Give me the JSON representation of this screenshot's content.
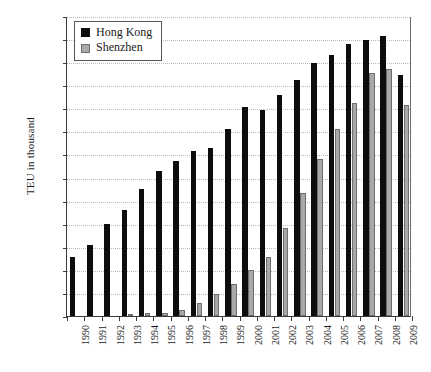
{
  "chart_data": {
    "type": "bar",
    "title": "",
    "xlabel": "",
    "ylabel": "TEU in thousand",
    "ylim": [
      0,
      26000
    ],
    "ytick_step": 2000,
    "ytick_labels": [
      "0",
      "2,000",
      "4,000",
      "6,000",
      "8,000",
      "10,000",
      "12,000",
      "14,000",
      "16,000",
      "18,000",
      "20,000",
      "22,000",
      "24,000",
      "26,000"
    ],
    "grid": true,
    "legend_position": "top-left",
    "categories": [
      "1990",
      "1991",
      "1992",
      "1993",
      "1994",
      "1995",
      "1996",
      "1997",
      "1998",
      "1999",
      "2000",
      "2001",
      "2002",
      "2003",
      "2004",
      "2005",
      "2006",
      "2007",
      "2008",
      "2009"
    ],
    "series": [
      {
        "name": "Hong Kong",
        "color": "#0d0d0d",
        "values": [
          5100,
          6160,
          7970,
          9200,
          11000,
          12550,
          13460,
          14280,
          14580,
          16210,
          18100,
          17830,
          19140,
          20450,
          21930,
          22600,
          23540,
          23880,
          24300,
          20900
        ]
      },
      {
        "name": "Shenzhen",
        "color": "#a8a8a8",
        "values": [
          0,
          0,
          0,
          200,
          220,
          280,
          490,
          1150,
          1950,
          2800,
          3990,
          5080,
          7610,
          10650,
          13650,
          16200,
          18470,
          21100,
          21400,
          18250
        ]
      }
    ]
  },
  "legend": {
    "entries": [
      {
        "label": "Hong Kong",
        "swatch": "hk"
      },
      {
        "label": "Shenzhen",
        "swatch": "sz"
      }
    ]
  }
}
